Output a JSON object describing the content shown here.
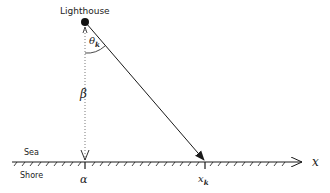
{
  "diagram": {
    "labels": {
      "lighthouse": "Lighthouse",
      "theta": "θ",
      "theta_sub": "k",
      "beta": "β",
      "alpha": "α",
      "xk": "x",
      "xk_sub": "k",
      "x_axis": "x",
      "sea": "Sea",
      "shore": "Shore"
    },
    "geometry": {
      "lighthouse_point": [
        85,
        22
      ],
      "alpha_point": [
        85,
        162
      ],
      "xk_point": [
        205,
        162
      ],
      "shoreline_y": 162,
      "axis_end_x": 302
    },
    "colors": {
      "stroke": "#1a1a1a",
      "text": "#222222",
      "background": "#ffffff"
    }
  }
}
